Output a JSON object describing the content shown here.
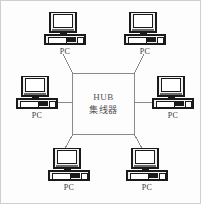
{
  "diagram": {
    "type": "network-topology",
    "hub": {
      "label_latin": "HUB",
      "label_cjk": "集线器",
      "shape": "rectangle",
      "x": 72,
      "y": 73,
      "width": 63,
      "height": 62
    },
    "colors": {
      "background": "#fdfdfd",
      "frame": "#cfcfcf",
      "line": "#8a8a8a",
      "box_stroke": "#8a8a8a",
      "icon_dark": "#1a1a1a",
      "icon_mid": "#6b6b6b",
      "icon_light": "#f2f2f2",
      "text": "#3a3a3a",
      "hub_text": "#555555"
    },
    "nodes": [
      {
        "id": "pc-top-left",
        "label": "PC",
        "x": 42,
        "y": 12,
        "icon": "desktop-computer-icon"
      },
      {
        "id": "pc-top-right",
        "label": "PC",
        "x": 122,
        "y": 12,
        "icon": "desktop-computer-icon"
      },
      {
        "id": "pc-middle-left",
        "label": "PC",
        "x": 14,
        "y": 76,
        "icon": "desktop-computer-icon"
      },
      {
        "id": "pc-middle-right",
        "label": "PC",
        "x": 150,
        "y": 76,
        "icon": "desktop-computer-icon"
      },
      {
        "id": "pc-bottom-left",
        "label": "PC",
        "x": 46,
        "y": 148,
        "icon": "desktop-computer-icon"
      },
      {
        "id": "pc-bottom-right",
        "label": "PC",
        "x": 124,
        "y": 148,
        "icon": "desktop-computer-icon"
      }
    ],
    "links": [
      {
        "from": "hub-corner-top-left",
        "to": "pc-top-left",
        "x1": 73,
        "y1": 74,
        "x2": 63,
        "y2": 54
      },
      {
        "from": "hub-corner-top-right",
        "to": "pc-top-right",
        "x1": 134,
        "y1": 74,
        "x2": 144,
        "y2": 54
      },
      {
        "from": "hub-edge-left",
        "to": "pc-middle-left",
        "x1": 72,
        "y1": 102,
        "x2": 50,
        "y2": 102
      },
      {
        "from": "hub-edge-right",
        "to": "pc-middle-right",
        "x1": 135,
        "y1": 102,
        "x2": 158,
        "y2": 102
      },
      {
        "from": "hub-corner-bottom-left",
        "to": "pc-bottom-left",
        "x1": 73,
        "y1": 134,
        "x2": 64,
        "y2": 150
      },
      {
        "from": "hub-corner-bottom-right",
        "to": "pc-bottom-right",
        "x1": 134,
        "y1": 134,
        "x2": 143,
        "y2": 150
      }
    ]
  }
}
